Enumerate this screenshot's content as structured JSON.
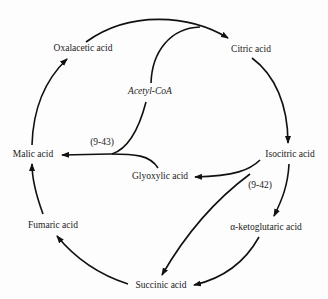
{
  "diagram": {
    "type": "metabolic-cycle",
    "nodes": {
      "oxalacetic": "Oxalacetic acid",
      "citric": "Citric acid",
      "acetyl_coa": "Acetyl-CoA",
      "malic": "Malic acid",
      "isocitric": "Isocitric acid",
      "glyoxylic": "Glyoxylic acid",
      "fumaric": "Fumaric acid",
      "ketoglutaric": "α-ketoglutaric acid",
      "succinic": "Succinic acid"
    },
    "reaction_labels": {
      "r943": "(9-43)",
      "r942": "(9-42)"
    },
    "edges": [
      {
        "from": "Oxalacetic acid",
        "to": "Citric acid"
      },
      {
        "from": "Acetyl-CoA",
        "to": "Citric acid"
      },
      {
        "from": "Citric acid",
        "to": "Isocitric acid"
      },
      {
        "from": "Isocitric acid",
        "to": "α-ketoglutaric acid"
      },
      {
        "from": "α-ketoglutaric acid",
        "to": "Succinic acid"
      },
      {
        "from": "Succinic acid",
        "to": "Fumaric acid"
      },
      {
        "from": "Fumaric acid",
        "to": "Malic acid"
      },
      {
        "from": "Malic acid",
        "to": "Oxalacetic acid"
      },
      {
        "from": "Isocitric acid",
        "to": "Glyoxylic acid",
        "reaction": "(9-42)"
      },
      {
        "from": "Isocitric acid",
        "to": "Succinic acid",
        "reaction": "(9-42)"
      },
      {
        "from": "Glyoxylic acid",
        "to": "Malic acid",
        "reaction": "(9-43)"
      },
      {
        "from": "Acetyl-CoA",
        "to": "Malic acid",
        "reaction": "(9-43)"
      }
    ],
    "line_color": "#111111"
  }
}
